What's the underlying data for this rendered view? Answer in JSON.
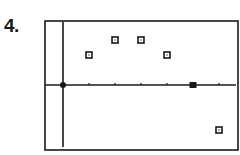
{
  "problem_label": "4.",
  "chart_data": {
    "type": "scatter",
    "title": "",
    "xlabel": "",
    "ylabel": "",
    "grid": false,
    "legend": null,
    "x_ticks": [
      1,
      2,
      3,
      4,
      5,
      6
    ],
    "points": [
      {
        "x": 1,
        "y": 2,
        "marker": "open-square"
      },
      {
        "x": 2,
        "y": 3,
        "marker": "open-square"
      },
      {
        "x": 3,
        "y": 3,
        "marker": "open-square"
      },
      {
        "x": 4,
        "y": 2,
        "marker": "open-square"
      },
      {
        "x": 5,
        "y": 0,
        "marker": "filled-square"
      },
      {
        "x": 6,
        "y": -3,
        "marker": "open-square"
      }
    ],
    "xlim": [
      -0.7,
      6.8
    ],
    "ylim": [
      -4.3,
      4.3
    ],
    "colors": {
      "ink": "#1a1a1a",
      "background": "#ffffff"
    }
  }
}
